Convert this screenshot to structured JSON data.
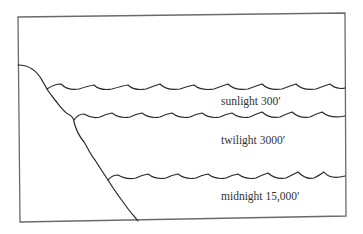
{
  "diagram": {
    "type": "ocean-depth-zones",
    "zones": [
      {
        "name": "sunlight",
        "depth": "300′",
        "label": "sunlight 300′"
      },
      {
        "name": "twilight",
        "depth": "3000′",
        "label": "twilight 3000′"
      },
      {
        "name": "midnight",
        "depth": "15,000′",
        "label": "midnight 15,000′"
      }
    ],
    "colors": {
      "line": "#2a2a2a",
      "frame": "#6a6a6a",
      "text": "#333333",
      "background": "#ffffff"
    }
  }
}
